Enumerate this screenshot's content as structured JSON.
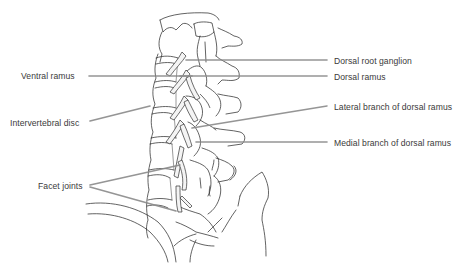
{
  "diagram": {
    "type": "anatomical-illustration",
    "leader_line_color": "#8a8a8a",
    "label_color": "#3a3a3a",
    "labels": {
      "dorsal_root_ganglion": "Dorsal root ganglion",
      "dorsal_ramus": "Dorsal ramus",
      "lateral_branch": "Lateral branch of dorsal ramus",
      "medial_branch": "Medial branch of dorsal ramus",
      "ventral_ramus": "Ventral ramus",
      "intervertebral_disc": "Intervertebral disc",
      "facet_joints": "Facet joints"
    }
  }
}
